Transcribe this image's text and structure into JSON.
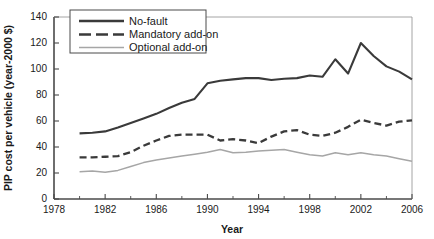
{
  "chart_data": {
    "type": "line",
    "title": "",
    "xlabel": "Year",
    "ylabel": "PIP cost per vehicle (year-2000 $)",
    "xlim": [
      1978,
      2006
    ],
    "ylim": [
      0,
      140
    ],
    "grid": false,
    "legend_position": "top-left",
    "xticks": [
      1978,
      1982,
      1986,
      1990,
      1994,
      1998,
      2002,
      2006
    ],
    "xticklabels": [
      "1978",
      "1982",
      "1986",
      "1990",
      "1994",
      "1998",
      "2002",
      "2006"
    ],
    "xminorticks": [
      1980,
      1984,
      1988,
      1992,
      1996,
      2000,
      2004
    ],
    "yticks": [
      0,
      20,
      40,
      60,
      80,
      100,
      120,
      140
    ],
    "yticklabels": [
      "0",
      "20",
      "40",
      "60",
      "80",
      "100",
      "120",
      "140"
    ],
    "x": [
      1980,
      1981,
      1982,
      1983,
      1984,
      1985,
      1986,
      1987,
      1988,
      1989,
      1990,
      1991,
      1992,
      1993,
      1994,
      1995,
      1996,
      1997,
      1998,
      1999,
      2000,
      2001,
      2002,
      2003,
      2004,
      2005,
      2006
    ],
    "series": [
      {
        "name": "No-fault",
        "style": "solid",
        "color": "#3a3a3a",
        "values": [
          50.5,
          51.0,
          52.0,
          55.0,
          58.5,
          62.0,
          65.5,
          70.0,
          74.0,
          77.0,
          89.0,
          91.0,
          92.0,
          93.0,
          93.0,
          91.5,
          92.5,
          93.0,
          95.0,
          94.0,
          107.5,
          96.5,
          120.0,
          110.0,
          102.0,
          98.0,
          92.0
        ]
      },
      {
        "name": "Mandatory add-on",
        "style": "dashed",
        "color": "#3a3a3a",
        "values": [
          32.0,
          32.0,
          32.5,
          33.0,
          36.0,
          41.0,
          45.0,
          48.5,
          49.5,
          49.5,
          49.5,
          45.0,
          46.0,
          45.0,
          43.0,
          48.0,
          52.0,
          53.0,
          49.5,
          48.5,
          51.0,
          55.5,
          61.0,
          58.5,
          56.5,
          59.5,
          60.5
        ]
      },
      {
        "name": "Optional add-on",
        "style": "thin-solid",
        "color": "#a6a6a6",
        "values": [
          21.0,
          21.5,
          20.5,
          22.0,
          25.0,
          28.0,
          30.0,
          31.5,
          33.0,
          34.5,
          36.0,
          38.0,
          35.5,
          36.0,
          37.0,
          37.5,
          38.0,
          36.0,
          34.0,
          33.0,
          35.5,
          34.0,
          35.5,
          34.0,
          33.0,
          31.0,
          29.0
        ]
      }
    ]
  },
  "legend": {
    "items": [
      {
        "label": "No-fault"
      },
      {
        "label": "Mandatory add-on"
      },
      {
        "label": "Optional add-on"
      }
    ]
  }
}
